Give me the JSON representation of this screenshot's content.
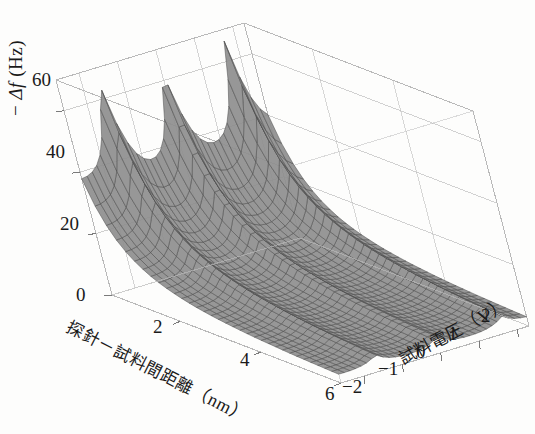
{
  "figure": {
    "kind": "3d-surface-plot",
    "background_color": "#fdfdfc",
    "line_color": "#4a4a4a",
    "box_color": "#b9b9b9",
    "surface_fill": "#8e8e8e",
    "text_color": "#1a1a1a"
  },
  "axes": {
    "z": {
      "title_prefix": "−",
      "title_symbol": "Δf",
      "title_unit": "(Hz)",
      "title_full": "− Δf (Hz)",
      "ticks": [
        "0",
        "20",
        "40",
        "60"
      ],
      "values": [
        0,
        20,
        40,
        60
      ],
      "min": 0,
      "max": 70
    },
    "x": {
      "title_jp": "探針－試料間距離",
      "title_unit": "（nm）",
      "title_full": "探針－試料間距離（nm）",
      "ticks": [
        "2",
        "4",
        "6"
      ],
      "values": [
        2,
        4,
        6
      ],
      "min": 0.3,
      "max": 6
    },
    "y": {
      "title_jp": "試料電圧",
      "title_unit": "（V）",
      "title_full": "試料電圧（V）",
      "ticks": [
        "−2",
        "−1",
        "0",
        "1",
        "2"
      ],
      "values": [
        -2,
        -1,
        0,
        1,
        2
      ],
      "min": -2.6,
      "max": 2.3
    }
  },
  "chart_data": {
    "type": "surface",
    "title": "",
    "xlabel": "探針－試料間距離（nm）",
    "ylabel": "試料電圧（V）",
    "zlabel": "− Δf (Hz)",
    "xlim": [
      0.3,
      6
    ],
    "ylim": [
      -2.6,
      2.3
    ],
    "zlim": [
      0,
      70
    ],
    "grid": true,
    "legend": "none",
    "peaks": [
      {
        "voltage": -1.6,
        "distance": 0.35,
        "minus_df": 64
      },
      {
        "voltage": 0.0,
        "distance": 0.35,
        "minus_df": 67
      },
      {
        "voltage": 1.7,
        "distance": 0.35,
        "minus_df": 70
      }
    ],
    "valleys": [
      {
        "voltage": -0.8,
        "distance": 0.35,
        "minus_df": 38
      },
      {
        "voltage": 0.9,
        "distance": 0.35,
        "minus_df": 40
      }
    ],
    "surface_model": {
      "baseline": "A / (d + d0)^n",
      "A": 26.0,
      "d0": 0.55,
      "n": 1.35,
      "ridge_amplitude": 42.0,
      "ridge_centers": [
        -1.6,
        0.0,
        1.7
      ],
      "ridge_width": 0.3,
      "ridge_decay": 1.15,
      "offset_quadratic": 0.55
    },
    "grid_counts": {
      "x_lines": 34,
      "y_lines": 34
    }
  },
  "tick_positions": {
    "z": [
      {
        "label": "0",
        "x": 100,
        "y": 295
      },
      {
        "label": "20",
        "x": 84,
        "y": 224
      },
      {
        "label": "40",
        "x": 70,
        "y": 152
      },
      {
        "label": "60",
        "x": 56,
        "y": 80
      }
    ],
    "x": [
      {
        "label": "2",
        "x": 158,
        "y": 327
      },
      {
        "label": "4",
        "x": 245,
        "y": 360
      },
      {
        "label": "6",
        "x": 330,
        "y": 394
      }
    ],
    "y": [
      {
        "label": "−2",
        "x": 350,
        "y": 387
      },
      {
        "label": "−1",
        "x": 386,
        "y": 369
      },
      {
        "label": "0",
        "x": 424,
        "y": 352
      },
      {
        "label": "1",
        "x": 456,
        "y": 334
      },
      {
        "label": "2",
        "x": 489,
        "y": 316
      }
    ]
  }
}
